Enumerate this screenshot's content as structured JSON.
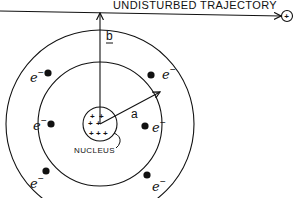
{
  "diagram": {
    "type": "atomic-collision-diagram",
    "trajectory": {
      "label": "UNDISTURBED TRAJECTORY",
      "projectile_symbol": "+"
    },
    "impact_parameter": {
      "label": "b"
    },
    "atomic_radius": {
      "label": "a"
    },
    "nucleus": {
      "label": "NUCLEUS",
      "charge_symbols": [
        "+",
        "+",
        "+",
        "+",
        "+",
        "+",
        "+"
      ]
    },
    "electrons": {
      "symbol": "e",
      "charge": "−",
      "inner_shell_count": 2,
      "outer_shell_count": 4
    }
  }
}
